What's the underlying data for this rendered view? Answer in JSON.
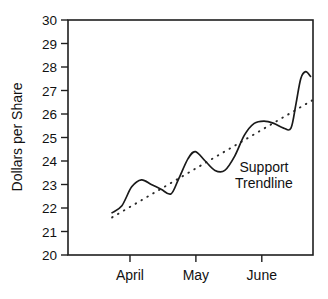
{
  "chart_data": {
    "type": "line",
    "title": "",
    "xlabel": "",
    "ylabel": "Dollars per Share",
    "ylim": [
      20,
      30
    ],
    "grid": false,
    "legend_position": "none",
    "y_ticks": [
      30,
      29,
      28,
      27,
      26,
      25,
      24,
      23,
      22,
      21,
      20
    ],
    "x_ticks": [
      "April",
      "May",
      "June"
    ],
    "annotations": [
      {
        "text_line_1": "Support",
        "text_line_2": "Trendline"
      }
    ],
    "series": [
      {
        "name": "Price",
        "style": "solid",
        "points": [
          {
            "x": 0.18,
            "y": 21.8
          },
          {
            "x": 0.22,
            "y": 22.1
          },
          {
            "x": 0.26,
            "y": 22.9
          },
          {
            "x": 0.3,
            "y": 23.2
          },
          {
            "x": 0.34,
            "y": 23.0
          },
          {
            "x": 0.38,
            "y": 22.8
          },
          {
            "x": 0.42,
            "y": 22.6
          },
          {
            "x": 0.45,
            "y": 23.2
          },
          {
            "x": 0.49,
            "y": 24.1
          },
          {
            "x": 0.52,
            "y": 24.4
          },
          {
            "x": 0.56,
            "y": 24.0
          },
          {
            "x": 0.6,
            "y": 23.6
          },
          {
            "x": 0.64,
            "y": 23.6
          },
          {
            "x": 0.68,
            "y": 24.2
          },
          {
            "x": 0.72,
            "y": 25.1
          },
          {
            "x": 0.76,
            "y": 25.6
          },
          {
            "x": 0.8,
            "y": 25.7
          },
          {
            "x": 0.84,
            "y": 25.6
          },
          {
            "x": 0.88,
            "y": 25.4
          },
          {
            "x": 0.91,
            "y": 25.4
          },
          {
            "x": 0.93,
            "y": 26.4
          },
          {
            "x": 0.95,
            "y": 27.5
          },
          {
            "x": 0.97,
            "y": 27.8
          },
          {
            "x": 0.99,
            "y": 27.6
          }
        ]
      },
      {
        "name": "Support Trendline",
        "style": "dotted",
        "points": [
          {
            "x": 0.18,
            "y": 21.6
          },
          {
            "x": 1.0,
            "y": 26.6
          }
        ]
      }
    ]
  },
  "axis": {
    "y_title": "Dollars per Share"
  }
}
